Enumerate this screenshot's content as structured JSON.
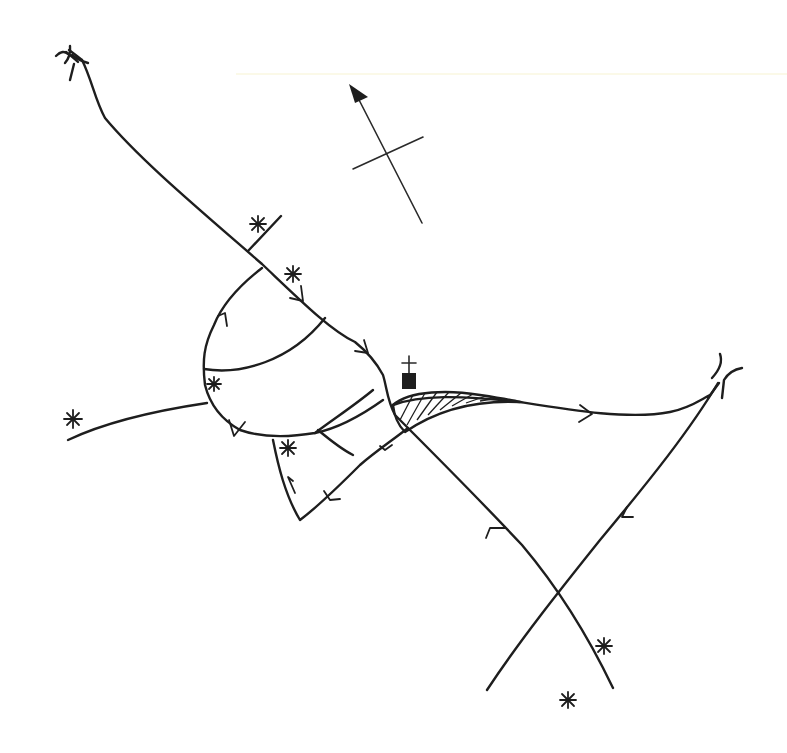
{
  "map": {
    "title": "",
    "background": "#ffffff",
    "ink_color": "#1e1e1e",
    "north_arrow": {
      "icon": "north-arrow-icon",
      "direction": "north-northwest"
    },
    "features": {
      "roads": [
        "northwest-road-from-bridge",
        "main-diagonal-road",
        "western-spur-road",
        "loop-road-west",
        "loop-road-inner-1",
        "loop-road-inner-2",
        "southern-lobe-road",
        "east-road-to-bridge",
        "southeast-diagonal-road",
        "northeast-to-southwest-road",
        "short-side-spur-north"
      ],
      "bridges": [
        "bridge-northwest",
        "bridge-east"
      ],
      "church": {
        "icon": "church-icon"
      },
      "hatched_area": {
        "icon": "hatched-field"
      },
      "markers": [
        {
          "icon": "asterisk-icon",
          "location": "north-spur"
        },
        {
          "icon": "asterisk-icon",
          "location": "main-road-north"
        },
        {
          "icon": "asterisk-icon",
          "location": "loop-west"
        },
        {
          "icon": "asterisk-icon",
          "location": "far-west"
        },
        {
          "icon": "asterisk-icon",
          "location": "southern-lobe"
        },
        {
          "icon": "asterisk-icon",
          "location": "southeast-1"
        },
        {
          "icon": "asterisk-icon",
          "location": "southeast-2"
        }
      ]
    }
  }
}
